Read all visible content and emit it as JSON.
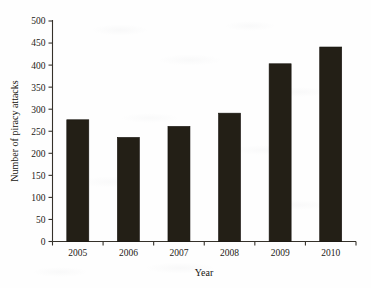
{
  "chart_data": {
    "type": "bar",
    "title": "",
    "subtitle": "",
    "xlabel": "Year",
    "ylabel": "Number of piracy attacks",
    "categories": [
      "2005",
      "2006",
      "2007",
      "2008",
      "2009",
      "2010"
    ],
    "values": [
      276,
      236,
      261,
      291,
      403,
      441
    ],
    "series": [
      {
        "name": "Number of piracy attacks",
        "values": [
          276,
          236,
          261,
          291,
          403,
          441
        ]
      }
    ],
    "ylim": [
      0,
      500
    ],
    "ytick_step": 50,
    "ytick_labels": [
      "0",
      "50",
      "100",
      "150",
      "200",
      "250",
      "300",
      "350",
      "400",
      "450",
      "500"
    ],
    "ytick_values": [
      0,
      50,
      100,
      150,
      200,
      250,
      300,
      350,
      400,
      450,
      500
    ],
    "grid": false,
    "legend": false,
    "legend_position": "none",
    "bar_color": "#231f16",
    "axis_color": "#35312a",
    "background_color": "#fefefe"
  },
  "figure": {
    "y_axis_label": "Number of piracy attacks",
    "x_axis_label": "Year"
  }
}
